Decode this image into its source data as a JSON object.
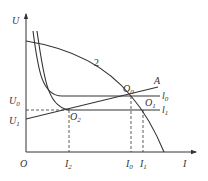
{
  "diagram": {
    "axes": {
      "y_label": "U",
      "x_label": "I",
      "origin_label": "O"
    },
    "y_ticks": [
      {
        "main": "U",
        "sub": "0"
      },
      {
        "main": "U",
        "sub": "1"
      }
    ],
    "x_ticks": [
      {
        "main": "I",
        "sub": "2"
      },
      {
        "main": "I",
        "sub": "0"
      },
      {
        "main": "I",
        "sub": "1"
      }
    ],
    "curve_labels": {
      "curve2": "2",
      "lineA": "A",
      "l0": {
        "main": "l",
        "sub": "0"
      },
      "l1": {
        "main": "l",
        "sub": "1"
      }
    },
    "points": [
      {
        "main": "O",
        "sub": "0"
      },
      {
        "main": "O",
        "sub": "1"
      },
      {
        "main": "O",
        "sub": "2"
      }
    ]
  }
}
